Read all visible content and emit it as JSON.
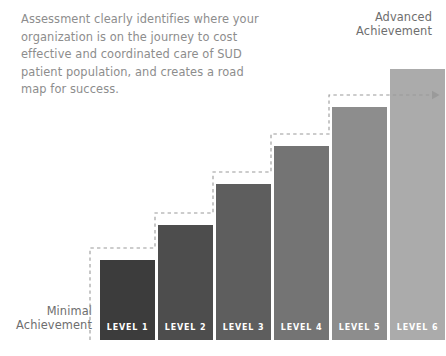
{
  "description": "Assessment clearly identifies where your\norganization is on the journey to cost\neffective and coordinated care of SUD\npatient population, and creates a road\nmap for success.",
  "callouts": {
    "minimal": "Minimal\nAchievement",
    "advanced": "Advanced\nAchievement"
  },
  "chart_data": {
    "type": "bar",
    "title": "",
    "subtitle": "",
    "xlabel": "",
    "ylabel": "",
    "grid": false,
    "legend": null,
    "orientation": "vertical",
    "categories": [
      "LEVEL 1",
      "LEVEL 2",
      "LEVEL 3",
      "LEVEL 4",
      "LEVEL 5",
      "LEVEL 6"
    ],
    "values": [
      1,
      2,
      3,
      4,
      5,
      6
    ],
    "ylim": [
      0,
      6
    ],
    "bar_colors": [
      "#3c3c3c",
      "#4d4d4d",
      "#5e5e5e",
      "#747474",
      "#8d8d8d",
      "#ababab"
    ],
    "annotations": [
      {
        "text": "Minimal Achievement",
        "position": "bottom-left"
      },
      {
        "text": "Advanced Achievement",
        "position": "top-right"
      }
    ],
    "bars": [
      {
        "label": "LEVEL 1",
        "value": 1,
        "color": "#3c3c3c",
        "x": 100,
        "y": 260,
        "width": 55,
        "height": 80
      },
      {
        "label": "LEVEL 2",
        "value": 2,
        "color": "#4d4d4d",
        "x": 158,
        "y": 225,
        "width": 55,
        "height": 115
      },
      {
        "label": "LEVEL 3",
        "value": 3,
        "color": "#5e5e5e",
        "x": 216,
        "y": 184,
        "width": 55,
        "height": 156
      },
      {
        "label": "LEVEL 4",
        "value": 4,
        "color": "#747474",
        "x": 274,
        "y": 146,
        "width": 55,
        "height": 194
      },
      {
        "label": "LEVEL 5",
        "value": 5,
        "color": "#8d8d8d",
        "x": 332,
        "y": 107,
        "width": 55,
        "height": 233
      },
      {
        "label": "LEVEL 6",
        "value": 6,
        "color": "#ababab",
        "x": 390,
        "y": 69,
        "width": 55,
        "height": 271
      }
    ],
    "step_line": {
      "style": "dashed",
      "color": "#9a9a9a",
      "arrow": "right",
      "points": "90,340 90,248 155,248 155,213 213,213 213,172 271,172 271,134 329,134 329,95 387,95 432,95"
    }
  }
}
